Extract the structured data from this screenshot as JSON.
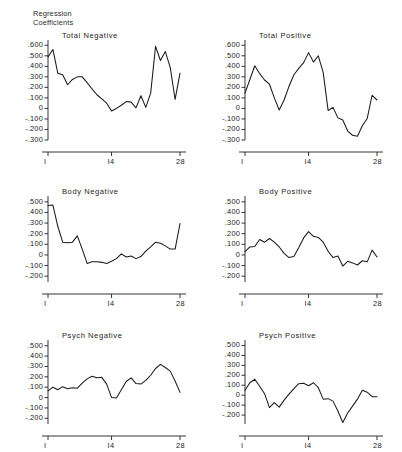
{
  "figure": {
    "axis_header": "Regression\nCoefficients",
    "background": "#ffffff",
    "line_color": "#1a1a1a"
  },
  "chart_data": [
    {
      "type": "line",
      "title": "Total Negative",
      "xlabel": "",
      "ylabel": "Regression Coefficients",
      "grid": false,
      "legend": "none",
      "xlim": [
        1,
        28
      ],
      "ylim": [
        -0.3,
        0.65
      ],
      "xticks": [
        1,
        14,
        28
      ],
      "xticklabels": [
        "I",
        "I4",
        "28"
      ],
      "yticks": [
        0.6,
        0.5,
        0.4,
        0.3,
        0.2,
        0.1,
        0,
        -0.1,
        -0.2,
        -0.3
      ],
      "yticklabels": [
        ".600",
        ".500",
        ".400",
        ".300",
        ".200",
        ".100",
        "0",
        "-.100",
        "-.200",
        "-.300"
      ],
      "x": [
        1,
        2,
        3,
        4,
        5,
        6,
        7,
        8,
        9,
        10,
        11,
        12,
        13,
        14,
        15,
        16,
        17,
        18,
        19,
        20,
        21,
        22,
        23,
        24,
        25,
        26,
        27,
        28
      ],
      "values": [
        0.49,
        0.56,
        0.335,
        0.32,
        0.225,
        0.275,
        0.3,
        0.3,
        0.245,
        0.185,
        0.13,
        0.09,
        0.05,
        -0.025,
        0.0,
        0.03,
        0.065,
        0.06,
        0.005,
        0.12,
        0.01,
        0.145,
        0.59,
        0.455,
        0.54,
        0.39,
        0.085,
        0.335
      ]
    },
    {
      "type": "line",
      "title": "Total Positive",
      "xlabel": "",
      "ylabel": "Regression Coefficients",
      "grid": false,
      "legend": "none",
      "xlim": [
        1,
        28
      ],
      "ylim": [
        -0.3,
        0.65
      ],
      "xticks": [
        1,
        14,
        28
      ],
      "xticklabels": [
        "I",
        "I4",
        "28"
      ],
      "yticks": [
        0.6,
        0.5,
        0.4,
        0.3,
        0.2,
        0.1,
        0,
        -0.1,
        -0.2,
        -0.3
      ],
      "yticklabels": [
        ".600",
        ".500",
        ".400",
        ".300",
        ".200",
        ".100",
        "0",
        "-.100",
        "-.200",
        "-.300"
      ],
      "x": [
        1,
        2,
        3,
        4,
        5,
        6,
        7,
        8,
        9,
        10,
        11,
        12,
        13,
        14,
        15,
        16,
        17,
        18,
        19,
        20,
        21,
        22,
        23,
        24,
        25,
        26,
        27,
        28
      ],
      "values": [
        0.145,
        0.275,
        0.405,
        0.33,
        0.27,
        0.23,
        0.1,
        -0.015,
        0.08,
        0.21,
        0.32,
        0.38,
        0.435,
        0.53,
        0.44,
        0.5,
        0.34,
        -0.02,
        0.01,
        -0.09,
        -0.11,
        -0.215,
        -0.255,
        -0.265,
        -0.165,
        -0.095,
        0.125,
        0.08
      ]
    },
    {
      "type": "line",
      "title": "Body Negative",
      "xlabel": "",
      "ylabel": "Regression Coefficients",
      "grid": false,
      "legend": "none",
      "xlim": [
        1,
        28
      ],
      "ylim": [
        -0.255,
        0.555
      ],
      "xticks": [
        1,
        14,
        28
      ],
      "xticklabels": [
        "I",
        "I4",
        "28"
      ],
      "yticks": [
        0.5,
        0.4,
        0.3,
        0.2,
        0.1,
        0,
        -0.1,
        -0.2
      ],
      "yticklabels": [
        ".500",
        ".400",
        ".300",
        ".200",
        ".100",
        "0",
        "-.100",
        "-.200"
      ],
      "x": [
        1,
        2,
        3,
        4,
        5,
        6,
        7,
        8,
        9,
        10,
        11,
        12,
        13,
        14,
        15,
        16,
        17,
        18,
        19,
        20,
        21,
        22,
        23,
        24,
        25,
        26,
        27,
        28
      ],
      "values": [
        0.465,
        0.47,
        0.27,
        0.12,
        0.115,
        0.12,
        0.18,
        0.055,
        -0.08,
        -0.065,
        -0.065,
        -0.07,
        -0.08,
        -0.06,
        -0.035,
        0.01,
        -0.02,
        -0.01,
        -0.035,
        -0.015,
        0.035,
        0.075,
        0.12,
        0.11,
        0.085,
        0.055,
        0.055,
        0.295
      ]
    },
    {
      "type": "line",
      "title": "Body Positive",
      "xlabel": "",
      "ylabel": "Regression Coefficients",
      "grid": false,
      "legend": "none",
      "xlim": [
        1,
        28
      ],
      "ylim": [
        -0.255,
        0.555
      ],
      "xticks": [
        1,
        14,
        28
      ],
      "xticklabels": [
        "I",
        "I4",
        "28"
      ],
      "yticks": [
        0.5,
        0.4,
        0.3,
        0.2,
        0.1,
        0,
        -0.1,
        -0.2
      ],
      "yticklabels": [
        ".500",
        ".400",
        ".300",
        ".200",
        ".100",
        "0",
        "-.100",
        "-.200"
      ],
      "x": [
        1,
        2,
        3,
        4,
        5,
        6,
        7,
        8,
        9,
        10,
        11,
        12,
        13,
        14,
        15,
        16,
        17,
        18,
        19,
        20,
        21,
        22,
        23,
        24,
        25,
        26,
        27,
        28
      ],
      "values": [
        0.03,
        0.075,
        0.08,
        0.145,
        0.12,
        0.155,
        0.12,
        0.075,
        0.015,
        -0.025,
        -0.015,
        0.07,
        0.16,
        0.22,
        0.175,
        0.165,
        0.12,
        0.035,
        -0.025,
        -0.01,
        -0.105,
        -0.06,
        -0.075,
        -0.095,
        -0.055,
        -0.065,
        0.045,
        -0.02
      ]
    },
    {
      "type": "line",
      "title": "Psych Negative",
      "xlabel": "",
      "ylabel": "Regression Coefficients",
      "grid": false,
      "legend": "none",
      "xlim": [
        1,
        28
      ],
      "ylim": [
        -0.255,
        0.555
      ],
      "xticks": [
        1,
        14,
        28
      ],
      "xticklabels": [
        "I",
        "I4",
        "28"
      ],
      "yticks": [
        0.5,
        0.4,
        0.3,
        0.2,
        0.1,
        0,
        -0.1,
        -0.2
      ],
      "yticklabels": [
        ".500",
        ".400",
        ".300",
        ".200",
        ".100",
        "0",
        "-.100",
        "-.200"
      ],
      "x": [
        1,
        2,
        3,
        4,
        5,
        6,
        7,
        8,
        9,
        10,
        11,
        12,
        13,
        14,
        15,
        16,
        17,
        18,
        19,
        20,
        21,
        22,
        23,
        24,
        25,
        26,
        27,
        28
      ],
      "values": [
        0.065,
        0.1,
        0.075,
        0.105,
        0.085,
        0.095,
        0.09,
        0.14,
        0.18,
        0.205,
        0.19,
        0.195,
        0.13,
        0.0,
        -0.005,
        0.075,
        0.155,
        0.19,
        0.135,
        0.13,
        0.165,
        0.215,
        0.28,
        0.32,
        0.29,
        0.255,
        0.16,
        0.05
      ]
    },
    {
      "type": "line",
      "title": "Psych Positive",
      "xlabel": "",
      "ylabel": "Regression Coefficients",
      "grid": false,
      "legend": "none",
      "xlim": [
        1,
        28
      ],
      "ylim": [
        -0.29,
        0.555
      ],
      "xticks": [
        1,
        14,
        28
      ],
      "xticklabels": [
        "I",
        "I4",
        "28"
      ],
      "yticks": [
        0.5,
        0.4,
        0.3,
        0.2,
        0.1,
        0,
        -0.1,
        -0.2
      ],
      "yticklabels": [
        ".500",
        ".400",
        ".300",
        ".200",
        ".100",
        "0",
        "-.100",
        "-.200"
      ],
      "x": [
        1,
        2,
        3,
        4,
        5,
        6,
        7,
        8,
        9,
        10,
        11,
        12,
        13,
        14,
        15,
        16,
        17,
        18,
        19,
        20,
        21,
        22,
        23,
        24,
        25,
        26,
        27,
        28
      ],
      "values": [
        0.05,
        0.125,
        0.16,
        0.09,
        0.015,
        -0.125,
        -0.075,
        -0.12,
        -0.05,
        0.01,
        0.065,
        0.115,
        0.12,
        0.095,
        0.125,
        0.075,
        -0.04,
        -0.035,
        -0.06,
        -0.16,
        -0.275,
        -0.18,
        -0.11,
        -0.04,
        0.05,
        0.03,
        -0.015,
        -0.015
      ]
    }
  ]
}
